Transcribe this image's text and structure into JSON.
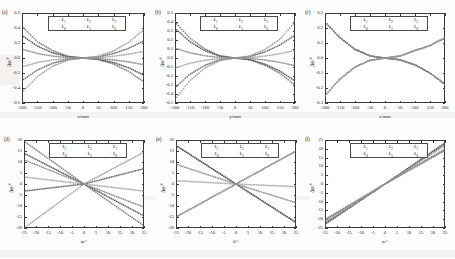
{
  "figure": {
    "background": "#fdfdfd",
    "axis_color": "#3a3a3a",
    "panel_count": 6,
    "series_names": [
      "L1",
      "L2",
      "L3",
      "L4",
      "L5",
      "L6"
    ],
    "series_labels": [
      "L",
      "L",
      "L",
      "L",
      "L",
      "L"
    ],
    "series_subs": [
      "1",
      "2",
      "3",
      "4",
      "5",
      "6"
    ],
    "series_colors": [
      "#7a7a7a",
      "#555555",
      "#8e8e8e",
      "#a9a9a9",
      "#6b6b6b",
      "#9c9c9c"
    ],
    "legend_marker": "+"
  },
  "chart_data": [
    {
      "type": "line",
      "panel": "(a)",
      "title": "",
      "xlabel": "x/mm",
      "ylabel": "Δφ/°",
      "xlim": [
        -200,
        200
      ],
      "ylim": [
        -0.6,
        0.6
      ],
      "xticks": [
        -200,
        -150,
        -100,
        -50,
        0,
        50,
        100,
        150,
        200
      ],
      "yticks": [
        -0.6,
        -0.4,
        -0.2,
        0.0,
        0.2,
        0.4,
        0.6
      ],
      "xticklabels": [
        "-200",
        "-150",
        "-100",
        "-50",
        "0",
        "50",
        "100",
        "150",
        "200"
      ],
      "yticklabels": [
        "-0.6",
        "-0.4",
        "-0.2",
        "0.0",
        "0.2",
        "0.4",
        "0.6"
      ],
      "grid": false,
      "legend_position": "upper-center",
      "x": [
        -200,
        -150,
        -100,
        -50,
        0,
        50,
        100,
        150,
        200
      ],
      "series": [
        {
          "name": "L1",
          "values": [
            0.42,
            0.22,
            0.1,
            0.025,
            0.0,
            -0.02,
            -0.08,
            -0.18,
            -0.32
          ]
        },
        {
          "name": "L2",
          "values": [
            0.3,
            0.16,
            0.07,
            0.018,
            0.0,
            -0.015,
            -0.06,
            -0.13,
            -0.23
          ]
        },
        {
          "name": "L3",
          "values": [
            0.12,
            0.06,
            0.026,
            0.007,
            0.0,
            -0.006,
            -0.024,
            -0.052,
            -0.09
          ]
        },
        {
          "name": "L4",
          "values": [
            -0.12,
            -0.06,
            -0.026,
            -0.007,
            0.0,
            0.006,
            0.024,
            0.052,
            0.09
          ]
        },
        {
          "name": "L5",
          "values": [
            -0.3,
            -0.16,
            -0.07,
            -0.018,
            0.0,
            0.015,
            0.06,
            0.13,
            0.23
          ]
        },
        {
          "name": "L6",
          "values": [
            -0.46,
            -0.25,
            -0.11,
            -0.028,
            0.0,
            0.024,
            0.095,
            0.21,
            0.38
          ]
        }
      ]
    },
    {
      "type": "line",
      "panel": "(b)",
      "title": "",
      "xlabel": "y/mm",
      "ylabel": "Δφ/°",
      "xlim": [
        -200,
        200
      ],
      "ylim": [
        -0.5,
        0.5
      ],
      "xticks": [
        -200,
        -150,
        -100,
        -50,
        0,
        50,
        100,
        150,
        200
      ],
      "yticks": [
        -0.5,
        -0.4,
        -0.3,
        -0.2,
        -0.1,
        0.0,
        0.1,
        0.2,
        0.3,
        0.4,
        0.5
      ],
      "xticklabels": [
        "-200",
        "-150",
        "-100",
        "-50",
        "0",
        "50",
        "100",
        "150",
        "200"
      ],
      "yticklabels": [
        "-0.5",
        "-0.4",
        "-0.3",
        "-0.2",
        "-0.1",
        "0.0",
        "0.1",
        "0.2",
        "0.3",
        "0.4",
        "0.5"
      ],
      "grid": false,
      "legend_position": "upper-center",
      "x": [
        -200,
        -150,
        -100,
        -50,
        0,
        50,
        100,
        150,
        200
      ],
      "series": [
        {
          "name": "L1",
          "values": [
            0.4,
            0.22,
            0.1,
            0.025,
            0.0,
            -0.02,
            -0.08,
            -0.17,
            -0.3
          ]
        },
        {
          "name": "L2",
          "values": [
            0.33,
            0.18,
            0.08,
            0.02,
            0.0,
            -0.017,
            -0.068,
            -0.145,
            -0.255
          ]
        },
        {
          "name": "L3",
          "values": [
            0.11,
            0.058,
            0.025,
            0.006,
            0.0,
            -0.005,
            -0.022,
            -0.048,
            -0.085
          ]
        },
        {
          "name": "L4",
          "values": [
            -0.11,
            -0.058,
            -0.025,
            -0.006,
            0.0,
            0.005,
            0.022,
            0.048,
            0.085
          ]
        },
        {
          "name": "L5",
          "values": [
            -0.33,
            -0.18,
            -0.08,
            -0.02,
            0.0,
            0.017,
            0.068,
            0.145,
            0.255
          ]
        },
        {
          "name": "L6",
          "values": [
            -0.46,
            -0.25,
            -0.11,
            -0.027,
            0.0,
            0.024,
            0.095,
            0.21,
            0.4
          ]
        }
      ]
    },
    {
      "type": "line",
      "panel": "(c)",
      "title": "",
      "xlabel": "z/mm",
      "ylabel": "Δφ/°",
      "xlim": [
        -200,
        200
      ],
      "ylim": [
        -0.3,
        0.3
      ],
      "xticks": [
        -200,
        -150,
        -100,
        -50,
        0,
        50,
        100,
        150,
        200
      ],
      "yticks": [
        -0.3,
        -0.2,
        -0.1,
        0.0,
        0.1,
        0.2,
        0.3
      ],
      "xticklabels": [
        "-200",
        "-150",
        "-100",
        "-50",
        "0",
        "50",
        "100",
        "150",
        "200"
      ],
      "yticklabels": [
        "-0.3",
        "-0.2",
        "-0.1",
        "0.0",
        "0.1",
        "0.2",
        "0.3"
      ],
      "grid": false,
      "legend_position": "upper-center",
      "x": [
        -200,
        -150,
        -100,
        -50,
        0,
        50,
        100,
        150,
        200
      ],
      "series": [
        {
          "name": "L1",
          "values": [
            0.24,
            0.135,
            0.058,
            0.014,
            0.0,
            -0.012,
            -0.046,
            -0.1,
            -0.175
          ]
        },
        {
          "name": "L2",
          "values": [
            0.24,
            0.135,
            0.058,
            0.014,
            0.0,
            -0.012,
            -0.046,
            -0.1,
            -0.175
          ]
        },
        {
          "name": "L3",
          "values": [
            0.24,
            0.135,
            0.058,
            0.014,
            0.0,
            -0.012,
            -0.046,
            -0.1,
            -0.175
          ]
        },
        {
          "name": "L4",
          "values": [
            -0.25,
            -0.14,
            -0.06,
            -0.015,
            0.0,
            0.013,
            0.05,
            0.083,
            0.135
          ]
        },
        {
          "name": "L5",
          "values": [
            -0.25,
            -0.14,
            -0.06,
            -0.015,
            0.0,
            0.013,
            0.05,
            0.083,
            0.135
          ]
        },
        {
          "name": "L6",
          "values": [
            -0.25,
            -0.14,
            -0.06,
            -0.015,
            0.0,
            0.013,
            0.05,
            0.083,
            0.135
          ]
        }
      ]
    },
    {
      "type": "line",
      "panel": "(d)",
      "title": "",
      "xlabel": "ψ/°",
      "ylabel": "Δφ/°",
      "xlim": [
        -25,
        25
      ],
      "ylim": [
        -20,
        20
      ],
      "xticks": [
        -25,
        -20,
        -15,
        -10,
        -5,
        0,
        5,
        10,
        15,
        20,
        25
      ],
      "yticks": [
        -20,
        -15,
        -10,
        -5,
        0,
        5,
        10,
        15,
        20
      ],
      "xticklabels": [
        "-25",
        "-20",
        "-15",
        "-10",
        "-5",
        "0",
        "5",
        "10",
        "15",
        "20",
        "25"
      ],
      "yticklabels": [
        "-20",
        "-15",
        "-10",
        "-5",
        "0",
        "5",
        "10",
        "15",
        "20"
      ],
      "grid": false,
      "legend_position": "upper-center",
      "x": [
        -25,
        0,
        25
      ],
      "series": [
        {
          "name": "L1",
          "values": [
            19.5,
            0.0,
            -19.0
          ]
        },
        {
          "name": "L2",
          "values": [
            14.0,
            0.0,
            -14.5
          ]
        },
        {
          "name": "L3",
          "values": [
            11.0,
            0.0,
            -10.5
          ]
        },
        {
          "name": "L4",
          "values": [
            3.2,
            0.0,
            -3.2
          ]
        },
        {
          "name": "L5",
          "values": [
            -3.2,
            0.0,
            7.0
          ]
        },
        {
          "name": "L6",
          "values": [
            -20.0,
            0.0,
            14.5
          ]
        }
      ]
    },
    {
      "type": "line",
      "panel": "(e)",
      "title": "",
      "xlabel": "θ/°",
      "ylabel": "Δφ/°",
      "xlim": [
        -25,
        25
      ],
      "ylim": [
        -20,
        20
      ],
      "xticks": [
        -25,
        -20,
        -15,
        -10,
        -5,
        0,
        5,
        10,
        15,
        20,
        25
      ],
      "yticks": [
        -20,
        -15,
        -10,
        -5,
        0,
        5,
        10,
        15,
        20
      ],
      "xticklabels": [
        "-25",
        "-20",
        "-15",
        "-10",
        "-5",
        "0",
        "5",
        "10",
        "15",
        "20",
        "25"
      ],
      "yticklabels": [
        "-20",
        "-15",
        "-10",
        "-5",
        "0",
        "5",
        "10",
        "15",
        "20"
      ],
      "grid": false,
      "legend_position": "upper-center",
      "x": [
        -25,
        0,
        25
      ],
      "series": [
        {
          "name": "L1",
          "values": [
            17.5,
            0.0,
            -17.5
          ]
        },
        {
          "name": "L2",
          "values": [
            17.5,
            0.0,
            -17.5
          ]
        },
        {
          "name": "L3",
          "values": [
            9.0,
            0.0,
            -8.5
          ]
        },
        {
          "name": "L4",
          "values": [
            1.5,
            0.0,
            -1.2
          ]
        },
        {
          "name": "L5",
          "values": [
            -15.0,
            0.0,
            15.0
          ]
        },
        {
          "name": "L6",
          "values": [
            -15.0,
            0.0,
            15.0
          ]
        }
      ]
    },
    {
      "type": "line",
      "panel": "(f)",
      "title": "",
      "xlabel": "φ/°",
      "ylabel": "Δφ/°",
      "xlim": [
        -25,
        25
      ],
      "ylim": [
        -25,
        25
      ],
      "xticks": [
        -25,
        -20,
        -15,
        -10,
        -5,
        0,
        5,
        10,
        15,
        20,
        25
      ],
      "yticks": [
        -25,
        -20,
        -15,
        -10,
        -5,
        0,
        5,
        10,
        15,
        20,
        25
      ],
      "xticklabels": [
        "-25",
        "-20",
        "-15",
        "-10",
        "-5",
        "0",
        "5",
        "10",
        "15",
        "20",
        "25"
      ],
      "yticklabels": [
        "-25",
        "-20",
        "-15",
        "-10",
        "-5",
        "0",
        "5",
        "10",
        "15",
        "20",
        "25"
      ],
      "grid": false,
      "legend_position": "upper-center",
      "x": [
        -25,
        0,
        25
      ],
      "series": [
        {
          "name": "L1",
          "values": [
            -23.0,
            0.0,
            23.5
          ]
        },
        {
          "name": "L2",
          "values": [
            -22.5,
            0.0,
            23.0
          ]
        },
        {
          "name": "L3",
          "values": [
            -22.0,
            0.0,
            22.0
          ]
        },
        {
          "name": "L4",
          "values": [
            -20.0,
            0.0,
            19.0
          ]
        },
        {
          "name": "L5",
          "values": [
            -20.5,
            0.0,
            19.5
          ]
        },
        {
          "name": "L6",
          "values": [
            -21.0,
            0.0,
            20.0
          ]
        }
      ]
    }
  ]
}
